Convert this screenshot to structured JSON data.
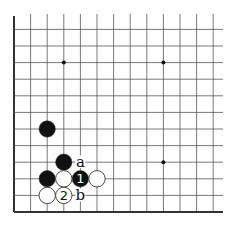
{
  "diagram": {
    "type": "go-board-fragment",
    "edges": [
      "left",
      "bottom"
    ],
    "grid": {
      "columns": 13,
      "rows": 12,
      "spacing": 16.6,
      "origin_x": 14,
      "bottom_y": 212,
      "line_color": "#555555",
      "edge_color": "#333333"
    },
    "star_points": [
      {
        "col": 3,
        "row": 9
      },
      {
        "col": 9,
        "row": 9
      },
      {
        "col": 9,
        "row": 3
      }
    ],
    "stones": [
      {
        "color": "black",
        "col": 2,
        "row": 5,
        "label": ""
      },
      {
        "color": "black",
        "col": 3,
        "row": 3,
        "label": ""
      },
      {
        "color": "black",
        "col": 2,
        "row": 2,
        "label": ""
      },
      {
        "color": "white",
        "col": 3,
        "row": 2,
        "label": ""
      },
      {
        "color": "black",
        "col": 4,
        "row": 2,
        "label": "1"
      },
      {
        "color": "white",
        "col": 5,
        "row": 2,
        "label": ""
      },
      {
        "color": "white",
        "col": 2,
        "row": 1,
        "label": ""
      },
      {
        "color": "white",
        "col": 3,
        "row": 1,
        "label": "2"
      }
    ],
    "markers": [
      {
        "col": 4,
        "row": 3,
        "label": "a"
      },
      {
        "col": 4,
        "row": 1,
        "label": "b"
      }
    ],
    "colors": {
      "black_stone": "#111111",
      "white_stone": "#ffffff",
      "stone_outline": "#333333"
    }
  }
}
